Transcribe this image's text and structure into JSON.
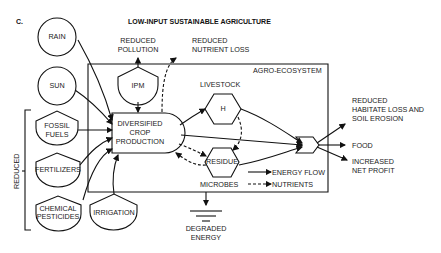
{
  "figure": {
    "panel_label": "C.",
    "title": "LOW-INPUT SUSTAINABLE AGRICULTURE",
    "system_label": "AGRO-ECOSYSTEM"
  },
  "nodes": {
    "rain": "RAIN",
    "sun": "SUN",
    "fossil_1": "FOSSIL",
    "fossil_2": "FUELS",
    "fertilizers": "FERTILIZERS",
    "chem_1": "CHEMICAL",
    "chem_2": "PESTICIDES",
    "irrigation": "IRRIGATION",
    "ipm": "IPM",
    "crop_1": "DIVERSIFIED",
    "crop_2": "CROP",
    "crop_3": "PRODUCTION",
    "livestock_label": "LIVESTOCK",
    "herbivore": "H",
    "residue": "RESIDUE",
    "microbes_label": "MICROBES",
    "reduced_bracket": "REDUCED"
  },
  "outputs": {
    "pollution_1": "REDUCED",
    "pollution_2": "POLLUTION",
    "nutrient_1": "REDUCED",
    "nutrient_2": "NUTRIENT LOSS",
    "habitat_1": "REDUCED",
    "habitat_2": "HABITATE LOSS AND",
    "habitat_3": "SOIL EROSION",
    "food": "FOOD",
    "profit_1": "INCREASED",
    "profit_2": "NET PROFIT",
    "degraded_1": "DEGRADED",
    "degraded_2": "ENERGY"
  },
  "legend": {
    "energy": "ENERGY FLOW",
    "nutrients": "NUTRIENTS"
  },
  "colors": {
    "ink": "#111111",
    "background": "#ffffff"
  }
}
